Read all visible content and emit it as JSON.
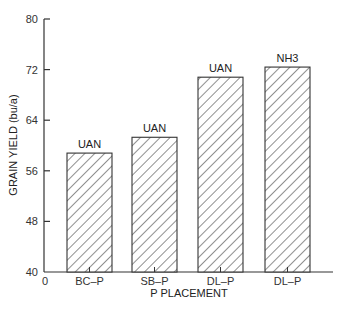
{
  "chart_data": {
    "type": "bar",
    "title": "",
    "xlabel": "P PLACEMENT",
    "ylabel": "GRAIN YIELD (bu/a)",
    "ylim": [
      40,
      80
    ],
    "yticks": [
      40,
      48,
      56,
      64,
      72,
      80
    ],
    "x_origin_label": "0",
    "grid": false,
    "legend": null,
    "categories": [
      "BC–P",
      "SB–P",
      "DL–P",
      "DL–P"
    ],
    "bar_annotations": [
      "UAN",
      "UAN",
      "UAN",
      "NH3"
    ],
    "values": [
      58.8,
      61.3,
      70.8,
      72.4
    ],
    "fill": "diagonal hatch",
    "colors": {
      "bar_stroke": "#333333",
      "hatch": "#444444",
      "axis": "#333333"
    }
  }
}
